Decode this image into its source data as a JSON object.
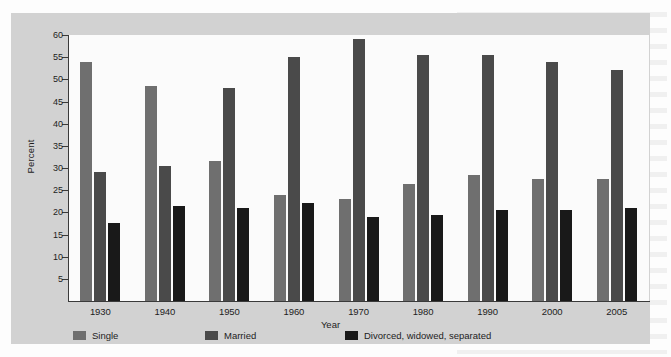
{
  "chart_data": {
    "type": "bar",
    "title": "",
    "xlabel": "Year",
    "ylabel": "Percent",
    "ylim": [
      0,
      60
    ],
    "yticks": [
      5,
      10,
      15,
      20,
      25,
      30,
      35,
      40,
      45,
      50,
      55,
      60
    ],
    "grid": false,
    "legend_position": "bottom-left",
    "categories": [
      "1930",
      "1940",
      "1950",
      "1960",
      "1970",
      "1980",
      "1990",
      "2000",
      "2005"
    ],
    "series": [
      {
        "name": "Single",
        "color": "#6f6f6f",
        "values": [
          54,
          48.5,
          31.5,
          24,
          23,
          26.5,
          28.5,
          27.5,
          27.5
        ]
      },
      {
        "name": "Married",
        "color": "#4a4a4a",
        "values": [
          29,
          30.5,
          48,
          55,
          59,
          55.5,
          55.5,
          54,
          52
        ]
      },
      {
        "name": "Divorced, widowed, separated",
        "color": "#191919",
        "values": [
          17.5,
          21.5,
          21,
          22,
          19,
          19.5,
          20.5,
          20.5,
          21
        ]
      }
    ]
  },
  "figure": {
    "panel_background": "#d2d2d2",
    "plot_background": "#fbfbfb",
    "axis_color": "#3a3a3a"
  }
}
